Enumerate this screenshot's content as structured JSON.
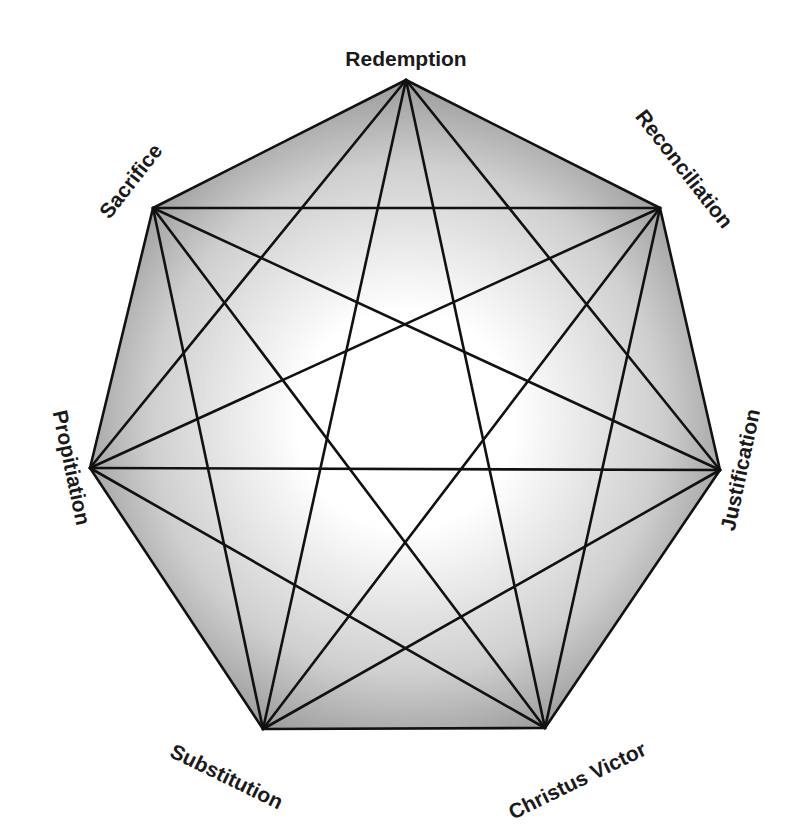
{
  "diagram": {
    "type": "heptagram-complete-graph",
    "colors": {
      "background": "#ffffff",
      "fill_center": "#ffffff",
      "fill_edge": "#9a9a9a",
      "line": "#111111",
      "label": "#1a1a1a"
    },
    "nodes": [
      {
        "id": "redemption",
        "label": "Redemption",
        "x": 406,
        "y": 80,
        "label_x": 406,
        "label_y": 60,
        "rotate": 0
      },
      {
        "id": "reconciliation",
        "label": "Reconciliation",
        "x": 660,
        "y": 208,
        "label_x": 683,
        "label_y": 170,
        "rotate": 52
      },
      {
        "id": "justification",
        "label": "Justification",
        "x": 720,
        "y": 470,
        "label_x": 742,
        "label_y": 470,
        "rotate": -78
      },
      {
        "id": "christus-victor",
        "label": "Christus Victor",
        "x": 545,
        "y": 728,
        "label_x": 578,
        "label_y": 782,
        "rotate": -26
      },
      {
        "id": "substitution",
        "label": "Substitution",
        "x": 263,
        "y": 729,
        "label_x": 226,
        "label_y": 778,
        "rotate": 26
      },
      {
        "id": "propitiation",
        "label": "Propitiation",
        "x": 90,
        "y": 468,
        "label_x": 70,
        "label_y": 468,
        "rotate": 78
      },
      {
        "id": "sacrifice",
        "label": "Sacrifice",
        "x": 153,
        "y": 208,
        "label_x": 132,
        "label_y": 182,
        "rotate": -52
      }
    ]
  }
}
